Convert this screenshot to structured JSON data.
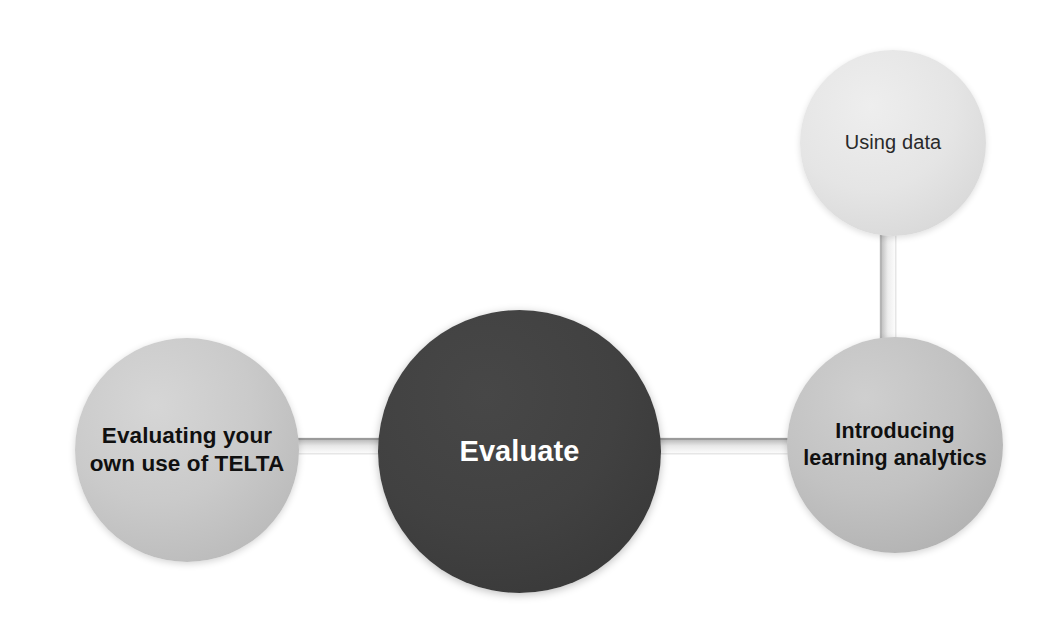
{
  "diagram": {
    "title": "Evaluate",
    "type": "hub-and-spoke",
    "background_color": "#ffffff",
    "nodes": [
      {
        "id": "evaluate",
        "label": "Evaluate",
        "role": "hub",
        "fill_color": "#3d3d3d",
        "text_color": "#ffffff",
        "diameter": 283,
        "center_x": 519,
        "center_y": 451
      },
      {
        "id": "evaluating-own-use",
        "label": "Evaluating your own use of TELTA",
        "role": "spoke",
        "fill_color": "#c8c8c8",
        "text_color": "#101010",
        "diameter": 224,
        "center_x": 187,
        "center_y": 450
      },
      {
        "id": "introducing-learning-analytics",
        "label": "Introducing learning analytics",
        "role": "spoke",
        "fill_color": "#bdbdbd",
        "text_color": "#101010",
        "diameter": 216,
        "center_x": 895,
        "center_y": 445
      },
      {
        "id": "using-data",
        "label": "Using data",
        "role": "leaf",
        "fill_color": "#e2e2e2",
        "text_color": "#2a2a2a",
        "diameter": 186,
        "center_x": 893,
        "center_y": 143
      }
    ],
    "connectors": [
      {
        "id": "left-center",
        "from": "evaluating-own-use",
        "to": "evaluate",
        "orientation": "horizontal",
        "color": "#d2d2d2"
      },
      {
        "id": "center-right",
        "from": "evaluate",
        "to": "introducing-learning-analytics",
        "orientation": "horizontal",
        "color": "#d2d2d2"
      },
      {
        "id": "right-top",
        "from": "introducing-learning-analytics",
        "to": "using-data",
        "orientation": "vertical",
        "color": "#d2d2d2"
      }
    ]
  }
}
